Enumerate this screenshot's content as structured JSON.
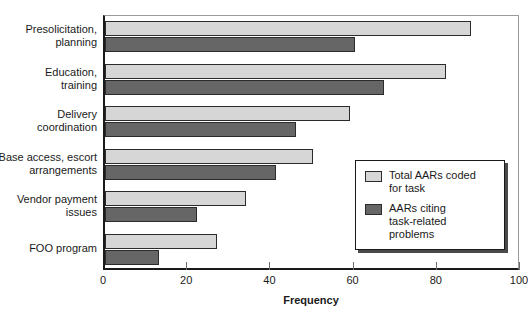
{
  "chart_data": {
    "type": "bar",
    "orientation": "horizontal",
    "title": "",
    "xlabel": "Frequency",
    "ylabel": "",
    "xlim": [
      0,
      100
    ],
    "xticks": [
      0,
      20,
      40,
      60,
      80,
      100
    ],
    "xtick_labels": [
      "0",
      "20",
      "40",
      "60",
      "80",
      "100"
    ],
    "grid": false,
    "legend_position": "inside-lower-right",
    "categories": [
      "Presolicitation, planning",
      "Education, training",
      "Delivery coordination",
      "Base access, escort arrangements",
      "Vendor payment issues",
      "FOO program"
    ],
    "category_lines": [
      [
        "Presolicitation,",
        "planning"
      ],
      [
        "Education,",
        "training"
      ],
      [
        "Delivery",
        "coordination"
      ],
      [
        "Base access, escort",
        "arrangements"
      ],
      [
        "Vendor payment",
        "issues"
      ],
      [
        "FOO program"
      ]
    ],
    "series": [
      {
        "name": "Total AARs coded for task",
        "name_lines": [
          "Total AARs coded",
          "for task"
        ],
        "color": "#d6d6d6",
        "values": [
          88,
          82,
          59,
          50,
          34,
          27
        ]
      },
      {
        "name": "AARs citing task-related problems",
        "name_lines": [
          "AARs citing",
          "task-related",
          "problems"
        ],
        "color": "#666666",
        "values": [
          60,
          67,
          46,
          41,
          22,
          13
        ]
      }
    ]
  },
  "colors": {
    "series_total": "#d6d6d6",
    "series_problems": "#666666",
    "axis": "#1a1a1a",
    "background": "#ffffff"
  }
}
